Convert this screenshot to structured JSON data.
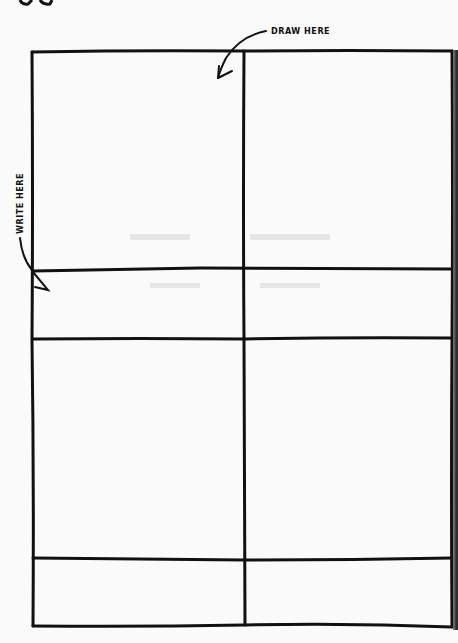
{
  "page": {
    "type": "comic-panel-worksheet",
    "background": "#fafafa",
    "line_color": "#111111"
  },
  "labels": {
    "draw": "DRAW HERE",
    "write": "WRITE HERE"
  },
  "icons": {
    "draw_arrow": "curved-arrow-down-left-icon",
    "write_arrow": "curved-arrow-down-icon"
  },
  "panels": [
    {
      "row": 1,
      "col": 1,
      "kind": "drawing-area"
    },
    {
      "row": 1,
      "col": 2,
      "kind": "drawing-area"
    },
    {
      "row": 1,
      "col": 1,
      "kind": "caption-area"
    },
    {
      "row": 1,
      "col": 2,
      "kind": "caption-area"
    },
    {
      "row": 2,
      "col": 1,
      "kind": "drawing-area"
    },
    {
      "row": 2,
      "col": 2,
      "kind": "drawing-area"
    },
    {
      "row": 2,
      "col": 1,
      "kind": "caption-area"
    },
    {
      "row": 2,
      "col": 2,
      "kind": "caption-area"
    }
  ]
}
